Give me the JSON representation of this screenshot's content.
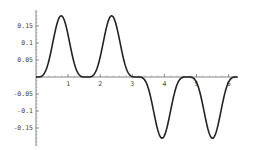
{
  "chart_data": {
    "type": "line",
    "title": "",
    "xlabel": "",
    "ylabel": "",
    "xlim": [
      0,
      6.3
    ],
    "ylim": [
      -0.2,
      0.2
    ],
    "x_ticks": [
      "1",
      "2",
      "3",
      "4",
      "5",
      "6"
    ],
    "y_ticks": [
      "0.15",
      "0.1",
      "0.05",
      "-0.05",
      "-0.1",
      "-0.15"
    ],
    "grid": false,
    "legend": "none",
    "series": [
      {
        "name": "f(x)",
        "x": [
          0,
          0.3,
          0.55,
          0.8,
          1.05,
          1.3,
          1.57,
          1.85,
          2.1,
          2.35,
          2.6,
          2.85,
          3.14,
          3.45,
          3.7,
          3.95,
          4.2,
          4.45,
          4.71,
          5.0,
          5.25,
          5.5,
          5.75,
          6.0,
          6.28
        ],
        "y": [
          0,
          0.02,
          0.1,
          0.17,
          0.16,
          0.08,
          0,
          0.08,
          0.17,
          0.17,
          0.1,
          0.02,
          0,
          -0.02,
          -0.1,
          -0.17,
          -0.16,
          -0.08,
          0,
          -0.08,
          -0.17,
          -0.17,
          -0.1,
          -0.02,
          0
        ]
      }
    ]
  }
}
